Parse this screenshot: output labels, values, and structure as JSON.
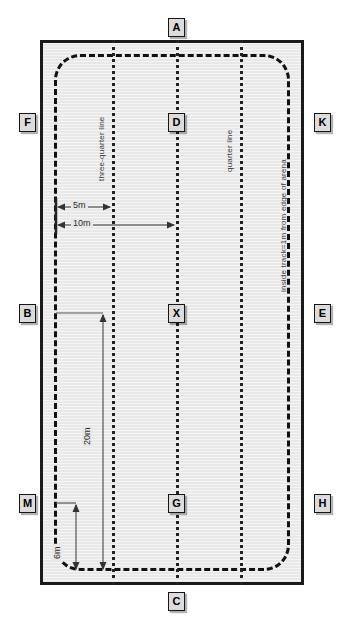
{
  "diagram": {
    "arena": {
      "fill_color": "#e8e8e8",
      "border_color": "#1a1a1a"
    },
    "markers": [
      {
        "id": "A",
        "label": "A",
        "position": "top-centre"
      },
      {
        "id": "F",
        "label": "F",
        "position": "left-upper"
      },
      {
        "id": "K",
        "label": "K",
        "position": "right-upper"
      },
      {
        "id": "D",
        "label": "D",
        "position": "centreline-upper"
      },
      {
        "id": "B",
        "label": "B",
        "position": "left-middle"
      },
      {
        "id": "E",
        "label": "E",
        "position": "right-middle"
      },
      {
        "id": "X",
        "label": "X",
        "position": "centre"
      },
      {
        "id": "M",
        "label": "M",
        "position": "left-lower"
      },
      {
        "id": "H",
        "label": "H",
        "position": "right-lower"
      },
      {
        "id": "G",
        "label": "G",
        "position": "centreline-lower"
      },
      {
        "id": "C",
        "label": "C",
        "position": "bottom-centre"
      }
    ],
    "line_labels": {
      "three_quarter_line": "three-quarter line",
      "quarter_line": "quarter line",
      "inside_track": "inside track=1m from edge of arena"
    },
    "dimensions": [
      {
        "id": "d5m",
        "label": "5m",
        "orientation": "horizontal",
        "from": "left edge",
        "to": "three-quarter line"
      },
      {
        "id": "d10m",
        "label": "10m",
        "orientation": "horizontal",
        "from": "left edge",
        "to": "centre line"
      },
      {
        "id": "d20m",
        "label": "20m",
        "orientation": "vertical",
        "from": "B level",
        "to": "bottom track"
      },
      {
        "id": "d6m",
        "label": "6m",
        "orientation": "vertical",
        "from": "M level",
        "to": "bottom track"
      }
    ]
  }
}
